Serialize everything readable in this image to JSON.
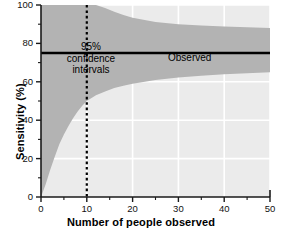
{
  "chart_data": {
    "type": "area",
    "title": "",
    "subtitle": "",
    "xlabel": "Number of people observed",
    "ylabel": "Sensitivity (%)",
    "xlim": [
      0,
      50
    ],
    "ylim": [
      0,
      100
    ],
    "xticks": [
      0,
      10,
      20,
      30,
      40,
      50
    ],
    "yticks": [
      0,
      20,
      40,
      60,
      80,
      100
    ],
    "xtick_labels": [
      "0",
      "10",
      "20",
      "30",
      "40",
      "50"
    ],
    "ytick_labels": [
      "0",
      "20",
      "40",
      "60",
      "80",
      "100"
    ],
    "minor_xticks": [
      5,
      15,
      25,
      35,
      45
    ],
    "minor_yticks": [
      10,
      30,
      50,
      70,
      90
    ],
    "grid": true,
    "grid_color": "#ffffff",
    "plot_bg_color": "#ebebeb",
    "band_color": "#b3b3b3",
    "line_color": "#000000",
    "legend_position": "inline-annotation",
    "annotations": [
      {
        "name": "confidence-interval-label",
        "text_lines": [
          "95%",
          "confidence",
          "intervals"
        ],
        "x": 10,
        "y": 83
      },
      {
        "name": "observed-label",
        "text_lines": [
          "Observed"
        ],
        "x": 25,
        "y": 75
      }
    ],
    "series": [
      {
        "name": "Observed",
        "type": "line",
        "x": [
          0,
          50
        ],
        "values": [
          75,
          75
        ]
      },
      {
        "name": "95% confidence interval upper",
        "type": "line",
        "x": [
          0,
          1,
          2,
          3,
          4,
          5,
          6,
          7,
          8,
          9,
          10,
          12,
          14,
          16,
          18,
          20,
          25,
          30,
          35,
          40,
          45,
          50
        ],
        "values": [
          100,
          100,
          100,
          100,
          100,
          100,
          100,
          100,
          100,
          100,
          100,
          100,
          98.5,
          96.5,
          94.8,
          93.4,
          91.2,
          90.0,
          89.3,
          88.8,
          88.4,
          88.0
        ]
      },
      {
        "name": "95% confidence interval lower",
        "type": "line",
        "x": [
          0,
          1,
          2,
          3,
          4,
          5,
          6,
          7,
          8,
          9,
          10,
          12,
          14,
          16,
          18,
          20,
          25,
          30,
          35,
          40,
          45,
          50
        ],
        "values": [
          0,
          6.5,
          14.0,
          21.0,
          27.5,
          32.5,
          37.0,
          41.0,
          44.5,
          47.5,
          50.0,
          53.0,
          55.0,
          56.8,
          58.0,
          59.0,
          61.0,
          62.2,
          63.2,
          63.9,
          64.5,
          65.0
        ]
      }
    ],
    "reference_lines": [
      {
        "name": "sample-size-10-marker",
        "orientation": "vertical",
        "x": 10,
        "style": "dashed",
        "color": "#000000",
        "y_from": 0,
        "y_to": 100
      }
    ]
  }
}
